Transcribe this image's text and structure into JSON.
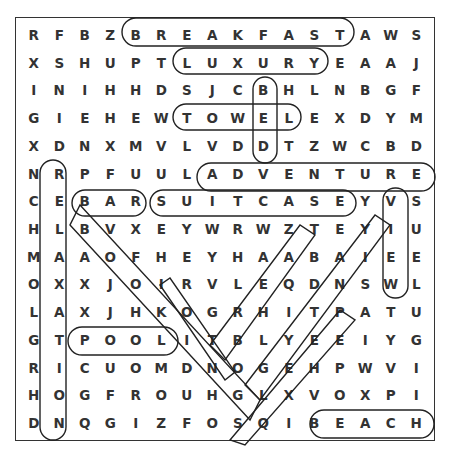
{
  "puzzle": {
    "type": "word-search",
    "rows": 15,
    "cols": 16,
    "grid": [
      [
        "R",
        "F",
        "B",
        "Z",
        "B",
        "R",
        "E",
        "A",
        "K",
        "F",
        "A",
        "S",
        "T",
        "A",
        "W",
        "S"
      ],
      [
        "X",
        "S",
        "H",
        "U",
        "P",
        "T",
        "L",
        "U",
        "X",
        "U",
        "R",
        "Y",
        "E",
        "A",
        "A",
        "J"
      ],
      [
        "I",
        "N",
        "I",
        "H",
        "H",
        "D",
        "S",
        "J",
        "C",
        "B",
        "H",
        "L",
        "N",
        "B",
        "G",
        "F"
      ],
      [
        "G",
        "I",
        "E",
        "H",
        "E",
        "W",
        "T",
        "O",
        "W",
        "E",
        "L",
        "E",
        "X",
        "D",
        "Y",
        "M"
      ],
      [
        "X",
        "D",
        "N",
        "X",
        "M",
        "V",
        "L",
        "V",
        "D",
        "D",
        "T",
        "Z",
        "W",
        "C",
        "B",
        "D"
      ],
      [
        "N",
        "R",
        "P",
        "F",
        "U",
        "U",
        "L",
        "A",
        "D",
        "V",
        "E",
        "N",
        "T",
        "U",
        "R",
        "E"
      ],
      [
        "C",
        "E",
        "B",
        "A",
        "R",
        "S",
        "U",
        "I",
        "T",
        "C",
        "A",
        "S",
        "E",
        "Y",
        "V",
        "S"
      ],
      [
        "H",
        "L",
        "B",
        "V",
        "X",
        "E",
        "Y",
        "W",
        "R",
        "W",
        "Z",
        "T",
        "E",
        "Y",
        "I",
        "U"
      ],
      [
        "M",
        "A",
        "A",
        "O",
        "F",
        "H",
        "E",
        "Y",
        "H",
        "A",
        "A",
        "B",
        "A",
        "I",
        "E",
        "E"
      ],
      [
        "O",
        "X",
        "X",
        "J",
        "O",
        "I",
        "R",
        "V",
        "L",
        "E",
        "Q",
        "D",
        "N",
        "S",
        "W",
        "L"
      ],
      [
        "L",
        "A",
        "X",
        "J",
        "H",
        "K",
        "O",
        "G",
        "R",
        "H",
        "I",
        "T",
        "P",
        "A",
        "T",
        "U"
      ],
      [
        "G",
        "T",
        "P",
        "O",
        "O",
        "L",
        "I",
        "T",
        "B",
        "L",
        "Y",
        "E",
        "E",
        "I",
        "Y",
        "G"
      ],
      [
        "R",
        "I",
        "C",
        "U",
        "O",
        "M",
        "D",
        "N",
        "O",
        "G",
        "E",
        "H",
        "P",
        "W",
        "V",
        "I"
      ],
      [
        "H",
        "O",
        "G",
        "F",
        "R",
        "O",
        "U",
        "H",
        "G",
        "L",
        "X",
        "V",
        "O",
        "X",
        "P",
        "I"
      ],
      [
        "D",
        "N",
        "Q",
        "G",
        "I",
        "Z",
        "F",
        "O",
        "S",
        "Q",
        "I",
        "B",
        "E",
        "A",
        "C",
        "H"
      ]
    ],
    "found_words": [
      "BREAKFAST",
      "LUXURY",
      "TOWEL",
      "BED",
      "ADVENTURE",
      "BAR",
      "SUITCASE",
      "VIEW",
      "POOL",
      "BEACH",
      "RELATION",
      "BOOKING",
      "TEA",
      "HOTEL",
      "HOLIDAY"
    ]
  }
}
